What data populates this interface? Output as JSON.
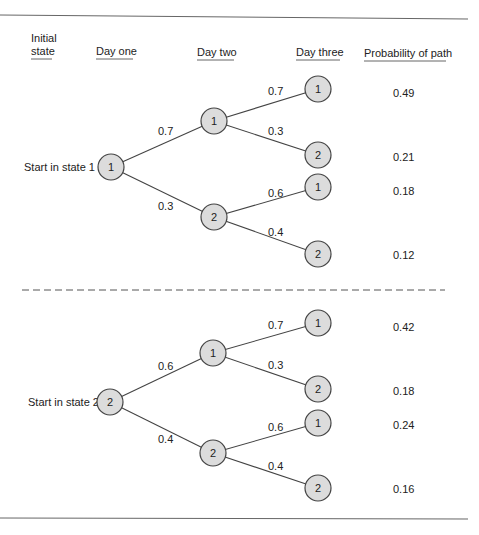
{
  "headers": {
    "initial_state_line1": "Initial",
    "initial_state_line2": "state",
    "day_one": "Day one",
    "day_two": "Day two",
    "day_three": "Day three",
    "probability": "Probability of path"
  },
  "trees": [
    {
      "start_label": "Start in state 1",
      "root": "1",
      "day_two": [
        {
          "state": "1",
          "prob": "0.7"
        },
        {
          "state": "2",
          "prob": "0.3"
        }
      ],
      "day_three": [
        {
          "state": "1",
          "prob": "0.7",
          "path_prob": "0.49"
        },
        {
          "state": "2",
          "prob": "0.3",
          "path_prob": "0.21"
        },
        {
          "state": "1",
          "prob": "0.6",
          "path_prob": "0.18"
        },
        {
          "state": "2",
          "prob": "0.4",
          "path_prob": "0.12"
        }
      ]
    },
    {
      "start_label": "Start in state 2",
      "root": "2",
      "day_two": [
        {
          "state": "1",
          "prob": "0.6"
        },
        {
          "state": "2",
          "prob": "0.4"
        }
      ],
      "day_three": [
        {
          "state": "1",
          "prob": "0.7",
          "path_prob": "0.42"
        },
        {
          "state": "2",
          "prob": "0.3",
          "path_prob": "0.18"
        },
        {
          "state": "1",
          "prob": "0.6",
          "path_prob": "0.24"
        },
        {
          "state": "2",
          "prob": "0.4",
          "path_prob": "0.16"
        }
      ]
    }
  ]
}
